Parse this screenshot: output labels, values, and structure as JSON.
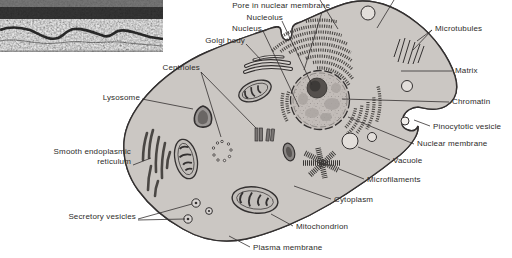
{
  "figure": {
    "type": "animal-cell-diagram",
    "background": "#ffffff",
    "ink_color": "#2e2c2a",
    "cell_fill": "#cbc7c3",
    "inset": {
      "name": "electron-micrograph-inset"
    }
  },
  "diagram": {
    "labels": [
      {
        "name": "pore-in-nuclear-membrane",
        "text": "Pore in nuclear membrane",
        "x": 180,
        "y": 1,
        "w": 150,
        "align": "right",
        "leaders": [
          [
            322,
            12,
            304,
            70
          ]
        ]
      },
      {
        "name": "nucleolus",
        "text": "Nucleolus",
        "x": 183,
        "y": 13,
        "w": 100,
        "align": "right",
        "leaders": [
          [
            282,
            21,
            312,
            85
          ]
        ]
      },
      {
        "name": "nucleus",
        "text": "Nucleus",
        "x": 162,
        "y": 24,
        "w": 100,
        "align": "right",
        "leaders": [
          [
            263,
            31,
            299,
            107
          ]
        ]
      },
      {
        "name": "golgi-body",
        "text": "Golgi body",
        "x": 145,
        "y": 36,
        "w": 100,
        "align": "right",
        "leaders": [
          [
            246,
            44,
            262,
            61
          ]
        ]
      },
      {
        "name": "centrioles",
        "text": "Centrioles",
        "x": 100,
        "y": 63,
        "w": 100,
        "align": "right",
        "leaders": [
          [
            201,
            72,
            221,
            137
          ],
          [
            201,
            72,
            256,
            128
          ]
        ]
      },
      {
        "name": "lysosome",
        "text": "Lysosome",
        "x": 40,
        "y": 93,
        "w": 100,
        "align": "right",
        "leaders": [
          [
            142,
            99,
            193,
            109
          ]
        ]
      },
      {
        "name": "smooth-endoplasmic-reticulum",
        "text": "Smooth endoplasmic\nreticulum",
        "x": 25,
        "y": 147,
        "w": 106,
        "align": "right",
        "leaders": [
          [
            133,
            165,
            151,
            158
          ]
        ]
      },
      {
        "name": "secretory-vesicles",
        "text": "Secretory vesicles",
        "x": 36,
        "y": 212,
        "w": 100,
        "align": "right",
        "leaders": [
          [
            138,
            219,
            192,
            204
          ],
          [
            138,
            220,
            185,
            219
          ]
        ]
      },
      {
        "name": "microtubules",
        "text": "Microtubules",
        "x": 435,
        "y": 24,
        "w": 75,
        "align": "left",
        "leaders": [
          [
            432,
            30,
            417,
            41
          ],
          [
            432,
            30,
            413,
            50
          ]
        ]
      },
      {
        "name": "matrix",
        "text": "Matrix",
        "x": 455,
        "y": 66,
        "w": 55,
        "align": "left",
        "leaders": [
          [
            452,
            71,
            401,
            71
          ]
        ]
      },
      {
        "name": "chromatin",
        "text": "Chromatin",
        "x": 452,
        "y": 97,
        "w": 58,
        "align": "left",
        "leaders": [
          [
            449,
            102,
            342,
            99
          ]
        ]
      },
      {
        "name": "pinocytotic-vesicle",
        "text": "Pinocytotic vesicle",
        "x": 433,
        "y": 122,
        "w": 79,
        "align": "left",
        "leaders": [
          [
            430,
            126,
            414,
            120
          ]
        ]
      },
      {
        "name": "nuclear-membrane",
        "text": "Nuclear membrane",
        "x": 417,
        "y": 139,
        "w": 92,
        "align": "left",
        "leaders": [
          [
            414,
            144,
            348,
            117
          ]
        ]
      },
      {
        "name": "vacuole",
        "text": "Vacuole",
        "x": 393,
        "y": 156,
        "w": 50,
        "align": "left",
        "leaders": [
          [
            390,
            160,
            358,
            147
          ]
        ]
      },
      {
        "name": "microfilaments",
        "text": "Microfilaments",
        "x": 367,
        "y": 175,
        "w": 70,
        "align": "left",
        "leaders": [
          [
            364,
            179,
            339,
            169
          ]
        ]
      },
      {
        "name": "cytoplasm",
        "text": "Cytoplasm",
        "x": 334,
        "y": 195,
        "w": 55,
        "align": "left",
        "leaders": [
          [
            331,
            199,
            294,
            186
          ]
        ]
      },
      {
        "name": "mitochondrion",
        "text": "Mitochondrion",
        "x": 296,
        "y": 222,
        "w": 70,
        "align": "left",
        "leaders": [
          [
            293,
            226,
            271,
            214
          ]
        ]
      },
      {
        "name": "plasma-membrane",
        "text": "Plasma membrane",
        "x": 253,
        "y": 243,
        "w": 90,
        "align": "left",
        "leaders": [
          [
            250,
            247,
            229,
            236
          ]
        ]
      }
    ],
    "cropped_leaders": [
      [
        320,
        0,
        338,
        29
      ],
      [
        394,
        0,
        377,
        28
      ]
    ]
  }
}
